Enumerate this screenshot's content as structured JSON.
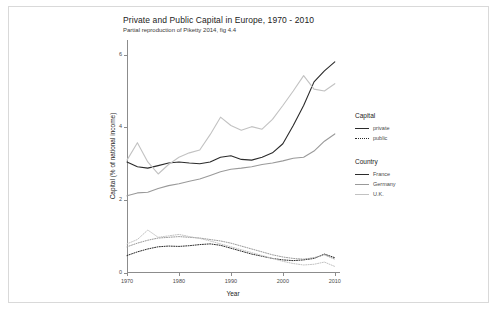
{
  "chart_data": {
    "type": "line",
    "title": "Private and Public Capital in Europe, 1970 - 2010",
    "subtitle": "Partial reproduction of Piketty 2014, fig 4.4",
    "xlabel": "Year",
    "ylabel": "Capital (% of national income)",
    "xlim": [
      1970,
      2011
    ],
    "ylim": [
      0,
      6.4
    ],
    "grid": false,
    "legend_position": "right",
    "x_ticks": [
      "1970",
      "1980",
      "1990",
      "2000",
      "2010"
    ],
    "x_tick_values": [
      1970,
      1980,
      1990,
      2000,
      2010
    ],
    "y_ticks": [
      "0",
      "2",
      "4",
      "6"
    ],
    "y_tick_values": [
      0,
      2,
      4,
      6
    ],
    "x": [
      1970,
      1972,
      1974,
      1976,
      1978,
      1980,
      1982,
      1984,
      1986,
      1988,
      1990,
      1992,
      1994,
      1996,
      1998,
      2000,
      2002,
      2004,
      2006,
      2008,
      2010
    ],
    "series": [
      {
        "name": "France private",
        "country": "France",
        "capital": "private",
        "style": "solid",
        "color": "#2b2b2b",
        "values": [
          3.05,
          2.92,
          2.88,
          2.95,
          3.02,
          3.05,
          3.02,
          3.0,
          3.05,
          3.18,
          3.22,
          3.12,
          3.1,
          3.18,
          3.3,
          3.55,
          4.05,
          4.6,
          5.25,
          5.55,
          5.8
        ]
      },
      {
        "name": "Germany private",
        "country": "Germany",
        "capital": "private",
        "style": "solid",
        "color": "#9a9a9a",
        "values": [
          2.12,
          2.2,
          2.22,
          2.32,
          2.4,
          2.45,
          2.52,
          2.58,
          2.68,
          2.78,
          2.85,
          2.88,
          2.92,
          2.98,
          3.02,
          3.08,
          3.15,
          3.18,
          3.35,
          3.62,
          3.82
        ]
      },
      {
        "name": "U.K. private",
        "country": "U.K.",
        "capital": "private",
        "style": "solid",
        "color": "#c2c2c2",
        "values": [
          3.1,
          3.58,
          3.05,
          2.72,
          2.98,
          3.18,
          3.3,
          3.38,
          3.8,
          4.28,
          4.05,
          3.92,
          4.02,
          3.95,
          4.22,
          4.6,
          5.0,
          5.42,
          5.05,
          5.0,
          5.2
        ]
      },
      {
        "name": "France public",
        "country": "France",
        "capital": "public",
        "style": "dotted",
        "color": "#2b2b2b",
        "values": [
          0.48,
          0.58,
          0.66,
          0.72,
          0.74,
          0.73,
          0.75,
          0.78,
          0.8,
          0.76,
          0.68,
          0.6,
          0.52,
          0.46,
          0.4,
          0.36,
          0.34,
          0.36,
          0.4,
          0.52,
          0.42
        ]
      },
      {
        "name": "Germany public",
        "country": "Germany",
        "capital": "public",
        "style": "dotted",
        "color": "#9a9a9a",
        "values": [
          0.72,
          0.82,
          0.9,
          0.96,
          0.98,
          1.0,
          0.98,
          0.96,
          0.92,
          0.88,
          0.82,
          0.74,
          0.66,
          0.58,
          0.5,
          0.44,
          0.4,
          0.38,
          0.42,
          0.5,
          0.38
        ]
      },
      {
        "name": "U.K. public",
        "country": "U.K.",
        "capital": "public",
        "style": "dotted",
        "color": "#c2c2c2",
        "values": [
          0.8,
          0.92,
          1.18,
          0.98,
          1.02,
          1.06,
          1.0,
          0.95,
          0.88,
          0.8,
          0.72,
          0.64,
          0.56,
          0.48,
          0.4,
          0.32,
          0.26,
          0.22,
          0.24,
          0.3,
          0.18
        ]
      }
    ],
    "legends": [
      {
        "title": "Capital",
        "entries": [
          {
            "label": "private",
            "style": "solid"
          },
          {
            "label": "public",
            "style": "dotted"
          }
        ]
      },
      {
        "title": "Country",
        "entries": [
          {
            "label": "France",
            "color": "#2b2b2b"
          },
          {
            "label": "Germany",
            "color": "#9a9a9a"
          },
          {
            "label": "U.K.",
            "color": "#c2c2c2"
          }
        ]
      }
    ]
  }
}
